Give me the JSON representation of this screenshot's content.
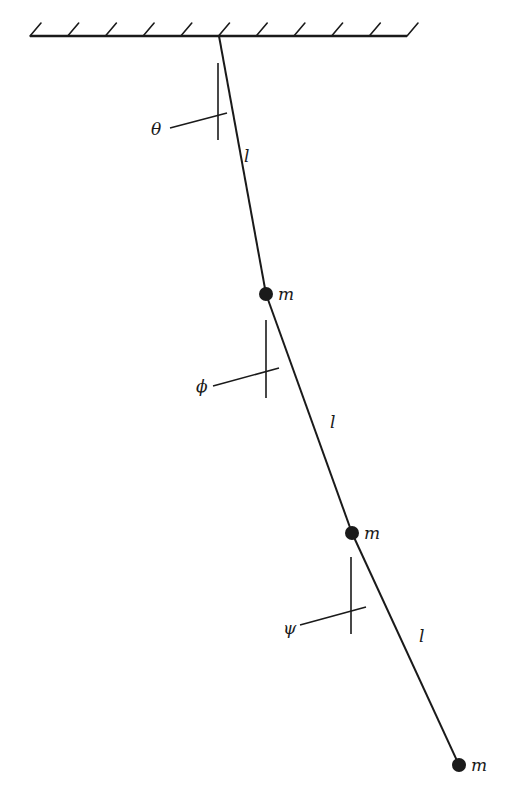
{
  "diagram": {
    "colors": {
      "ink": "#1a1a1a",
      "background": "#ffffff"
    },
    "support": {
      "type": "fixed-ceiling",
      "x1": 30,
      "x2": 407,
      "y": 36,
      "hatch_count": 11
    },
    "pivot": {
      "x": 219,
      "y": 36
    },
    "masses": [
      {
        "id": "m1",
        "label": "m",
        "x": 266,
        "y": 294,
        "r": 7
      },
      {
        "id": "m2",
        "label": "m",
        "x": 352,
        "y": 533,
        "r": 7
      },
      {
        "id": "m3",
        "label": "m",
        "x": 459,
        "y": 765,
        "r": 7
      }
    ],
    "rods": [
      {
        "id": "rod1",
        "label": "l",
        "label_x": 244,
        "label_y": 162
      },
      {
        "id": "rod2",
        "label": "l",
        "label_x": 330,
        "label_y": 428
      },
      {
        "id": "rod3",
        "label": "l",
        "label_x": 419,
        "label_y": 642
      }
    ],
    "angles": [
      {
        "id": "theta",
        "label": "θ",
        "vertical": {
          "x": 218,
          "y1": 63,
          "y2": 140
        },
        "leader": {
          "x1": 170,
          "y1": 128,
          "x2": 227,
          "y2": 113
        },
        "label_x": 151,
        "label_y": 135
      },
      {
        "id": "phi",
        "label": "ϕ",
        "vertical": {
          "x": 266,
          "y1": 320,
          "y2": 398
        },
        "leader": {
          "x1": 213,
          "y1": 386,
          "x2": 279,
          "y2": 368
        },
        "label_x": 196,
        "label_y": 392
      },
      {
        "id": "psi",
        "label": "ψ",
        "vertical": {
          "x": 351,
          "y1": 557,
          "y2": 634
        },
        "leader": {
          "x1": 300,
          "y1": 625,
          "x2": 366,
          "y2": 607
        },
        "label_x": 283,
        "label_y": 634
      }
    ]
  }
}
